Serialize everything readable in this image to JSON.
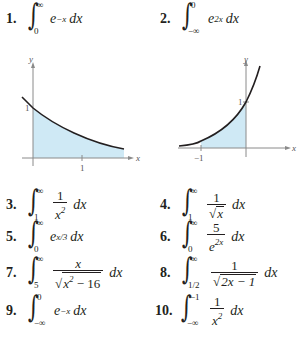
{
  "problems": [
    {
      "number": "1.",
      "lower": "0",
      "upper": "∞",
      "integrand": "e",
      "exp": "−x",
      "differential": "dx"
    },
    {
      "number": "2.",
      "lower": "−∞",
      "upper": "0",
      "integrand": "e",
      "exp": "2x",
      "differential": "dx"
    },
    {
      "number": "3.",
      "lower": "1",
      "upper": "∞",
      "numerator": "1",
      "denominator": "x",
      "den_exp": "2",
      "differential": "dx"
    },
    {
      "number": "4.",
      "lower": "1",
      "upper": "∞",
      "numerator": "1",
      "denominator": "x",
      "differential": "dx"
    },
    {
      "number": "5.",
      "lower": "0",
      "upper": "∞",
      "integrand": "e",
      "exp": "x/3",
      "differential": "dx"
    },
    {
      "number": "6.",
      "lower": "0",
      "upper": "∞",
      "numerator": "5",
      "denominator": "e",
      "den_exp": "2x",
      "differential": "dx"
    },
    {
      "number": "7.",
      "lower": "5",
      "upper": "∞",
      "numerator": "x",
      "denominator": "x",
      "den_exp": "2",
      "den_tail": " − 16",
      "differential": "dx"
    },
    {
      "number": "8.",
      "lower": "1/2",
      "upper": "∞",
      "numerator": "1",
      "denominator": "2x − 1",
      "differential": "dx"
    },
    {
      "number": "9.",
      "lower": "−∞",
      "upper": "0",
      "integrand": "e",
      "exp": "−x",
      "differential": "dx"
    },
    {
      "number": "10.",
      "lower": "−∞",
      "upper": "−1",
      "numerator": "1",
      "denominator": "x",
      "den_exp": "2",
      "differential": "dx"
    }
  ],
  "graphs": [
    {
      "function": "y = e^(−x)",
      "y_label": "y",
      "x_label": "x",
      "y_tick": "1",
      "x_tick": "1",
      "shade_color": "#cfe9f5",
      "curve_color": "#231f20"
    },
    {
      "function": "y = e^(2x)",
      "y_label": "y",
      "x_label": "x",
      "y_tick": "1",
      "x_tick": "−1",
      "shade_color": "#cfe9f5",
      "curve_color": "#231f20"
    }
  ]
}
